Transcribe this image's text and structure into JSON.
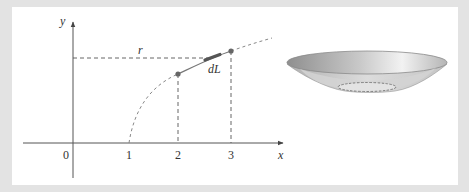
{
  "figure": {
    "axes": {
      "x_label": "x",
      "y_label": "y",
      "x_ticks": [
        "0",
        "1",
        "2",
        "3"
      ]
    },
    "annotations": {
      "radius_label": "r",
      "arc_element_label": "dL"
    },
    "curve": {
      "description": "curve starting at x=1 on the x-axis, rising concave-down; solid segment between x=2 and x=3 with highlighted element dL; dashed elsewhere",
      "marked_points_x": [
        2,
        3
      ]
    },
    "surface": {
      "description": "shaded bowl-shaped surface of revolution obtained by rotating the arc about the y-axis"
    },
    "colors": {
      "background_border": "#e3e3e3",
      "panel": "#ffffff",
      "axis": "#555555",
      "curve": "#777777",
      "dL_segment": "#555555",
      "bowl_dark": "#9a9a9a",
      "bowl_light": "#e8e8e8"
    }
  }
}
